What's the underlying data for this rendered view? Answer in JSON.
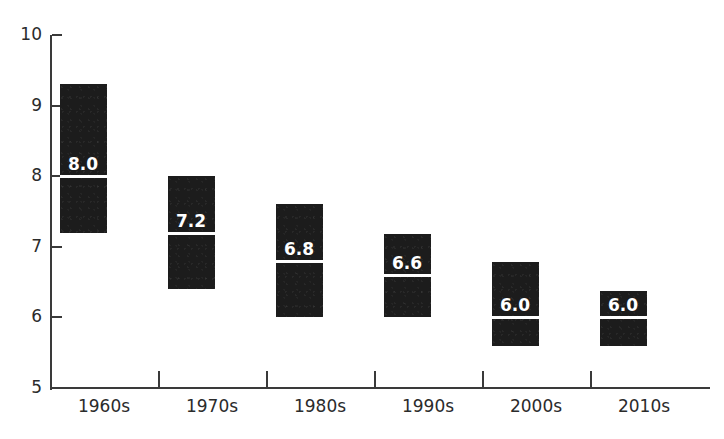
{
  "chart": {
    "title": "",
    "title_visible_fragment": "",
    "background_color": "#ffffff",
    "bar_color": "#1c1c1c",
    "median_line_color": "#ffffff",
    "axis_color": "#3a3a3a",
    "tick_label_color": "#2b2b2b"
  },
  "chart_data": {
    "type": "bar",
    "subtype": "floating-range-bar",
    "title": "",
    "xlabel": "",
    "ylabel": "",
    "categories": [
      "1960s",
      "1970s",
      "1980s",
      "1990s",
      "2000s",
      "2010s"
    ],
    "series": [
      {
        "name": "range_low",
        "values": [
          7.2,
          6.4,
          6.0,
          6.0,
          5.6,
          5.6
        ]
      },
      {
        "name": "range_high",
        "values": [
          9.3,
          8.0,
          7.6,
          7.18,
          6.78,
          6.38
        ]
      },
      {
        "name": "median",
        "values": [
          8.0,
          7.2,
          6.8,
          6.6,
          6.0,
          6.0
        ]
      }
    ],
    "data_labels": [
      "8.0",
      "7.2",
      "6.8",
      "6.6",
      "6.0",
      "6.0"
    ],
    "ylim": [
      5,
      10
    ],
    "yticks": [
      5,
      6,
      7,
      8,
      9,
      10
    ],
    "ytick_labels": [
      "5",
      "6",
      "7",
      "8",
      "9",
      "10"
    ],
    "grid": false,
    "legend": null,
    "legend_position": "none"
  },
  "bars": [
    {
      "category": "1960s",
      "low": 7.2,
      "high": 9.3,
      "median": 8.0,
      "label": "8.0"
    },
    {
      "category": "1970s",
      "low": 6.4,
      "high": 8.0,
      "median": 7.2,
      "label": "7.2"
    },
    {
      "category": "1980s",
      "low": 6.0,
      "high": 7.6,
      "median": 6.8,
      "label": "6.8"
    },
    {
      "category": "1990s",
      "low": 6.0,
      "high": 7.18,
      "median": 6.6,
      "label": "6.6"
    },
    {
      "category": "2000s",
      "low": 5.6,
      "high": 6.78,
      "median": 6.0,
      "label": "6.0"
    },
    {
      "category": "2010s",
      "low": 5.6,
      "high": 6.38,
      "median": 6.0,
      "label": "6.0"
    }
  ],
  "axes": {
    "y_ticks": [
      "10",
      "9",
      "8",
      "7",
      "6",
      "5"
    ],
    "x_ticks": [
      "1960s",
      "1970s",
      "1980s",
      "1990s",
      "2000s",
      "2010s"
    ]
  }
}
